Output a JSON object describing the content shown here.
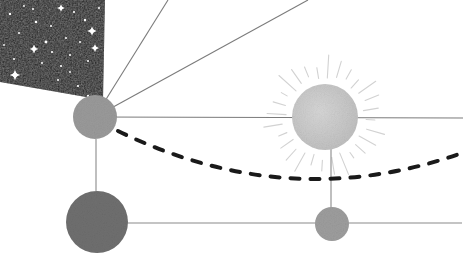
{
  "scene": {
    "title": "celestial-orbit-diagram",
    "width": 470,
    "height": 268,
    "background": "#ffffff"
  },
  "colors": {
    "night_sky": "#151515",
    "star": "#ffffff",
    "planet_upper": "#9a9a9a",
    "planet_lower_left": "#6f6f6f",
    "planet_lower_right": "#9d9d9d",
    "sun_disc": "#c9c9c9",
    "sun_ray": "#d2d2d2",
    "sight_line": "#7b7b7b",
    "axis_line": "#8a8a8a",
    "orbit_dash": "#1a1a1a"
  },
  "starfield": {
    "name": "night-sky-panel",
    "points": "0,0 105,0 103,100 0,82",
    "stars": [
      {
        "x": 10,
        "y": 14,
        "r": 1.2,
        "spike": 0
      },
      {
        "x": 36,
        "y": 22,
        "r": 1.3,
        "spike": 0
      },
      {
        "x": 33,
        "y": 9,
        "r": 1.0,
        "spike": 0
      },
      {
        "x": 61,
        "y": 8,
        "r": 1.5,
        "spike": 3.8
      },
      {
        "x": 74,
        "y": 12,
        "r": 1.1,
        "spike": 0
      },
      {
        "x": 19,
        "y": 33,
        "r": 1.0,
        "spike": 0
      },
      {
        "x": 51,
        "y": 26,
        "r": 1.0,
        "spike": 0
      },
      {
        "x": 85,
        "y": 20,
        "r": 1.2,
        "spike": 0
      },
      {
        "x": 92,
        "y": 31,
        "r": 1.9,
        "spike": 4.6
      },
      {
        "x": 46,
        "y": 42,
        "r": 1.4,
        "spike": 0
      },
      {
        "x": 66,
        "y": 38,
        "r": 1.0,
        "spike": 0
      },
      {
        "x": 80,
        "y": 42,
        "r": 1.0,
        "spike": 0
      },
      {
        "x": 95,
        "y": 48,
        "r": 1.7,
        "spike": 4.0
      },
      {
        "x": 52,
        "y": 52,
        "r": 1.1,
        "spike": 0
      },
      {
        "x": 34,
        "y": 49,
        "r": 2.0,
        "spike": 4.4
      },
      {
        "x": 70,
        "y": 55,
        "r": 1.0,
        "spike": 0
      },
      {
        "x": 14,
        "y": 59,
        "r": 1.0,
        "spike": 0
      },
      {
        "x": 42,
        "y": 63,
        "r": 1.0,
        "spike": 0
      },
      {
        "x": 61,
        "y": 66,
        "r": 1.1,
        "spike": 0
      },
      {
        "x": 88,
        "y": 61,
        "r": 1.0,
        "spike": 0
      },
      {
        "x": 15,
        "y": 75,
        "r": 2.3,
        "spike": 5.2
      },
      {
        "x": 58,
        "y": 80,
        "r": 1.0,
        "spike": 0
      },
      {
        "x": 78,
        "y": 86,
        "r": 1.1,
        "spike": 0
      },
      {
        "x": 88,
        "y": 96,
        "r": 1.2,
        "spike": 0
      },
      {
        "x": 24,
        "y": 6,
        "r": 0.9,
        "spike": 0
      },
      {
        "x": 99,
        "y": 8,
        "r": 1.0,
        "spike": 0
      },
      {
        "x": 4,
        "y": 45,
        "r": 0.9,
        "spike": 0
      },
      {
        "x": 70,
        "y": 72,
        "r": 0.9,
        "spike": 0
      }
    ]
  },
  "bodies": [
    {
      "name": "planet-upper-left",
      "label": "observer planet",
      "cx": 95,
      "cy": 117,
      "r": 22,
      "fill": "#9a9a9a"
    },
    {
      "name": "planet-lower-left",
      "label": "lower left planet",
      "cx": 97,
      "cy": 222,
      "r": 31,
      "fill": "#6f6f6f"
    },
    {
      "name": "planet-lower-right",
      "label": "small right planet",
      "cx": 332,
      "cy": 224,
      "r": 17,
      "fill": "#9d9d9d"
    },
    {
      "name": "sun",
      "label": "sun",
      "cx": 325,
      "cy": 117,
      "r": 33,
      "fill": "#c9c9c9"
    }
  ],
  "sun_rays": {
    "name": "sun-ray-group",
    "cx": 325,
    "cy": 117,
    "inner_radius": 39,
    "outer_radius": 62,
    "count": 28,
    "color": "#d2d2d2"
  },
  "sight_lines": [
    {
      "name": "sight-line-steep-up",
      "x1": 95,
      "y1": 117,
      "x2": 168,
      "y2": 0
    },
    {
      "name": "sight-line-diagonal",
      "x1": 95,
      "y1": 117,
      "x2": 308,
      "y2": 0
    },
    {
      "name": "sight-line-horizontal",
      "x1": 95,
      "y1": 117,
      "x2": 463,
      "y2": 118
    }
  ],
  "axis_lines": [
    {
      "name": "axis-line-lower-horizontal",
      "x1": 97,
      "y1": 223,
      "x2": 462,
      "y2": 223
    },
    {
      "name": "axis-line-left-vertical",
      "x1": 96,
      "y1": 139,
      "x2": 96,
      "y2": 191
    },
    {
      "name": "axis-line-right-vertical",
      "x1": 331,
      "y1": 140,
      "x2": 331,
      "y2": 208
    }
  ],
  "orbit_path": {
    "name": "orbit-dashed-arc",
    "d": "M 118 131 Q 290 215 465 152",
    "color": "#1a1a1a",
    "width": 4,
    "dash": "9 11",
    "linecap": "round"
  }
}
